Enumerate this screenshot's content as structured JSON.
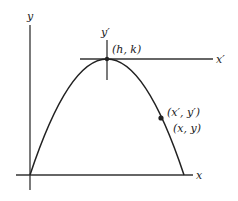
{
  "diagram": {
    "type": "parabola-translated-axes",
    "colors": {
      "background": "#ffffff",
      "line": "#333333",
      "text": "#222222"
    },
    "labels": {
      "y_axis": "y",
      "x_axis": "x",
      "y_prime_axis": "y′",
      "x_prime_axis": "x′",
      "vertex": "(h, k)",
      "point_primed": "(x′, y′)",
      "point_original": "(x, y)"
    },
    "geometry": {
      "origin": [
        30,
        175
      ],
      "vertex": [
        107,
        59
      ],
      "point": [
        161,
        118
      ],
      "curve_end": [
        184,
        175
      ]
    }
  }
}
